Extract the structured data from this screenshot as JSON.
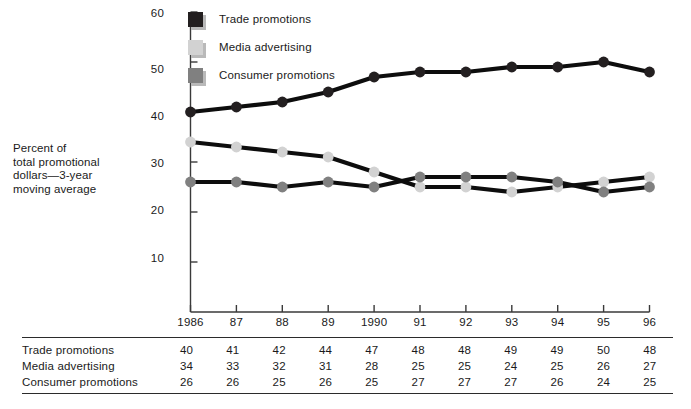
{
  "chart_data": {
    "type": "line",
    "title": "",
    "xlabel": "",
    "ylabel": "Percent of total promotional dollars—3-year moving average",
    "categories": [
      "1986",
      "87",
      "88",
      "89",
      "1990",
      "91",
      "92",
      "93",
      "94",
      "95",
      "96"
    ],
    "ylim": [
      0,
      60
    ],
    "yticks": [
      10,
      20,
      30,
      40,
      50,
      60
    ],
    "grid": false,
    "legend_position": "top-left-inside",
    "series": [
      {
        "name": "Trade promotions",
        "color": "#231f20",
        "values": [
          40,
          41,
          42,
          44,
          47,
          48,
          48,
          49,
          49,
          50,
          48
        ]
      },
      {
        "name": "Media advertising",
        "color": "#d2d2d2",
        "values": [
          34,
          33,
          32,
          31,
          28,
          25,
          25,
          24,
          25,
          26,
          27
        ]
      },
      {
        "name": "Consumer promotions",
        "color": "#808080",
        "values": [
          26,
          26,
          25,
          26,
          25,
          27,
          27,
          27,
          26,
          24,
          25
        ]
      }
    ]
  },
  "axis_caption": {
    "line1": "Percent of",
    "line2": "total promotional",
    "line3": "dollars—3-year",
    "line4": "moving average"
  },
  "legend": {
    "items": [
      {
        "label": "Trade promotions",
        "color": "#231f20"
      },
      {
        "label": "Media advertising",
        "color": "#d2d2d2"
      },
      {
        "label": "Consumer promotions",
        "color": "#808080"
      }
    ]
  },
  "y_axis": {
    "ticks": [
      "60",
      "50",
      "40",
      "30",
      "20",
      "10"
    ]
  },
  "x_axis": {
    "ticks": [
      "1986",
      "87",
      "88",
      "89",
      "1990",
      "91",
      "92",
      "93",
      "94",
      "95",
      "96"
    ]
  },
  "table": {
    "rows": [
      {
        "name": "Trade promotions",
        "values": [
          "40",
          "41",
          "42",
          "44",
          "47",
          "48",
          "48",
          "49",
          "49",
          "50",
          "48"
        ]
      },
      {
        "name": "Media advertising",
        "values": [
          "34",
          "33",
          "32",
          "31",
          "28",
          "25",
          "25",
          "24",
          "25",
          "26",
          "27"
        ]
      },
      {
        "name": "Consumer promotions",
        "values": [
          "26",
          "26",
          "25",
          "26",
          "25",
          "27",
          "27",
          "27",
          "26",
          "24",
          "25"
        ]
      }
    ]
  },
  "colors": {
    "axis": "#3a3a3a",
    "line": "#0d0d0d",
    "trade": "#231f20",
    "media": "#d2d2d2",
    "consumer": "#808080",
    "shadow": "#b9b9b9",
    "rule": "#2b2b2b"
  }
}
